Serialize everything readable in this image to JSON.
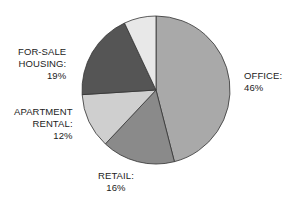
{
  "chart_data": {
    "type": "pie",
    "title": "",
    "categories": [
      "OFFICE",
      "RETAIL",
      "APARTMENT RENTAL",
      "FOR-SALE HOUSING",
      "OTHER (unlabeled)"
    ],
    "values": [
      46,
      16,
      12,
      19,
      7
    ],
    "colors": [
      "#a9a9a9",
      "#8a8a8a",
      "#cfcfcf",
      "#555555",
      "#e8e8e8"
    ],
    "start_angle_deg": 0,
    "direction": "clockwise"
  },
  "labels": {
    "office": {
      "name": "OFFICE:",
      "pct": "46%"
    },
    "retail": {
      "name": "RETAIL:",
      "pct": "16%"
    },
    "apartment": {
      "line1": "APARTMENT",
      "line2": "RENTAL:",
      "pct": "12%"
    },
    "forsale": {
      "line1": "FOR-SALE",
      "line2": "HOUSING:",
      "pct": "19%"
    }
  }
}
